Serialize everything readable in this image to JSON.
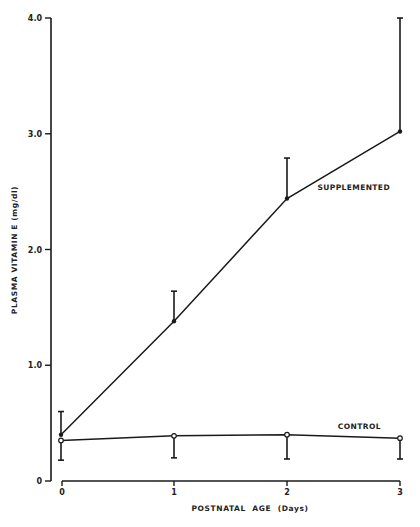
{
  "chart_data": {
    "type": "line",
    "title": "",
    "xlabel": "POSTNATAL  AGE  (Days)",
    "ylabel": "PLASMA  VITAMIN  E   (mg/dl)",
    "x": [
      0,
      1,
      2,
      3
    ],
    "x_tick_labels": [
      "0",
      "1",
      "2",
      "3"
    ],
    "y_ticks": [
      0,
      1.0,
      2.0,
      3.0,
      4.0
    ],
    "y_tick_labels": [
      "0",
      "1.0",
      "2.0",
      "3.0",
      "4.0"
    ],
    "ylim": [
      0,
      4.0
    ],
    "xlim": [
      0,
      3
    ],
    "grid": false,
    "legend": "inline labels",
    "series": [
      {
        "name": "SUPPLEMENTED",
        "values": [
          0.4,
          1.38,
          2.44,
          3.02
        ],
        "error_upper": [
          0.6,
          1.64,
          2.79,
          4.0
        ],
        "error_direction": "up",
        "marker": "filled-circle",
        "label_position": {
          "x": 2.27,
          "y": 2.51
        }
      },
      {
        "name": "CONTROL",
        "values": [
          0.35,
          0.39,
          0.4,
          0.37
        ],
        "error_lower": [
          0.18,
          0.2,
          0.19,
          0.19
        ],
        "error_direction": "down",
        "marker": "open-circle",
        "label_position": {
          "x": 2.45,
          "y": 0.45
        }
      }
    ]
  }
}
